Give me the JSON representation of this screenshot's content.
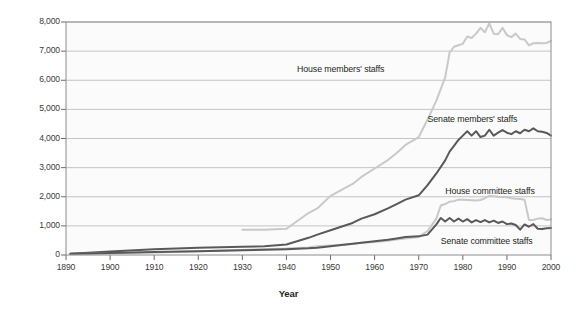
{
  "chart_data": {
    "type": "line",
    "title": "",
    "xlabel": "Year",
    "ylabel": "Number of Employees",
    "xlim": [
      1890,
      2000
    ],
    "ylim": [
      0,
      8000
    ],
    "grid": true,
    "legend_position": "inline-annotations",
    "xticks": [
      "1890",
      "1900",
      "1910",
      "1920",
      "1930",
      "1940",
      "1950",
      "1960",
      "1970",
      "1980",
      "1990",
      "2000"
    ],
    "yticks": [
      "0",
      "1,000",
      "2,000",
      "3,000",
      "4,000",
      "5,000",
      "6,000",
      "7,000",
      "8,000"
    ],
    "series": [
      {
        "name": "House members' staffs",
        "color": "#c9c9c9",
        "label_x": 1956,
        "label_y": 6350,
        "x": [
          1930,
          1935,
          1940,
          1945,
          1947,
          1950,
          1955,
          1957,
          1960,
          1963,
          1965,
          1967,
          1970,
          1972,
          1974,
          1976,
          1977,
          1978,
          1979,
          1980,
          1981,
          1982,
          1983,
          1984,
          1985,
          1986,
          1987,
          1988,
          1989,
          1990,
          1991,
          1992,
          1993,
          1994,
          1995,
          1996,
          1997,
          1998,
          1999,
          2000
        ],
        "values": [
          870,
          870,
          900,
          1440,
          1600,
          2030,
          2440,
          2680,
          2970,
          3260,
          3500,
          3780,
          4050,
          4650,
          5300,
          6100,
          6950,
          7150,
          7200,
          7250,
          7500,
          7450,
          7600,
          7800,
          7650,
          7950,
          7600,
          7580,
          7800,
          7550,
          7480,
          7600,
          7420,
          7400,
          7200,
          7270,
          7280,
          7270,
          7280,
          7350
        ]
      },
      {
        "name": "Senate members' staffs",
        "color": "#595959",
        "label_x": 1972,
        "label_y": 4620,
        "x": [
          1891,
          1900,
          1910,
          1920,
          1930,
          1935,
          1940,
          1945,
          1947,
          1950,
          1955,
          1957,
          1960,
          1963,
          1965,
          1967,
          1970,
          1972,
          1974,
          1976,
          1977,
          1978,
          1979,
          1980,
          1981,
          1982,
          1983,
          1984,
          1985,
          1986,
          1987,
          1988,
          1989,
          1990,
          1991,
          1992,
          1993,
          1994,
          1995,
          1996,
          1997,
          1998,
          1999,
          2000
        ],
        "values": [
          40,
          120,
          200,
          250,
          280,
          300,
          360,
          590,
          700,
          850,
          1100,
          1250,
          1400,
          1600,
          1750,
          1900,
          2050,
          2400,
          2800,
          3250,
          3550,
          3750,
          3950,
          4100,
          4250,
          4100,
          4250,
          4050,
          4100,
          4300,
          4100,
          4200,
          4290,
          4200,
          4150,
          4250,
          4180,
          4300,
          4250,
          4350,
          4250,
          4230,
          4190,
          4100
        ]
      },
      {
        "name": "House committee staffs",
        "color": "#c9c9c9",
        "label_x": 1976,
        "label_y": 2160,
        "x": [
          1891,
          1900,
          1910,
          1920,
          1930,
          1935,
          1940,
          1945,
          1947,
          1950,
          1955,
          1957,
          1960,
          1963,
          1965,
          1967,
          1970,
          1972,
          1974,
          1975,
          1976,
          1977,
          1978,
          1979,
          1980,
          1981,
          1982,
          1983,
          1984,
          1985,
          1986,
          1987,
          1988,
          1989,
          1990,
          1991,
          1992,
          1993,
          1994,
          1995,
          1996,
          1997,
          1998,
          1999,
          2000
        ],
        "values": [
          30,
          60,
          90,
          130,
          170,
          200,
          220,
          260,
          300,
          330,
          380,
          420,
          450,
          490,
          530,
          570,
          620,
          820,
          1250,
          1700,
          1750,
          1830,
          1850,
          1900,
          1900,
          1890,
          1880,
          1870,
          1890,
          1950,
          2030,
          2020,
          2000,
          1990,
          1980,
          1950,
          1930,
          1920,
          1900,
          1200,
          1200,
          1250,
          1260,
          1200,
          1220
        ]
      },
      {
        "name": "Senate committee staffs",
        "color": "#595959",
        "label_x": 1975,
        "label_y": 440,
        "x": [
          1891,
          1900,
          1910,
          1920,
          1930,
          1935,
          1940,
          1945,
          1947,
          1950,
          1955,
          1957,
          1960,
          1963,
          1965,
          1967,
          1970,
          1972,
          1974,
          1975,
          1976,
          1977,
          1978,
          1979,
          1980,
          1981,
          1982,
          1983,
          1984,
          1985,
          1986,
          1987,
          1988,
          1989,
          1990,
          1991,
          1992,
          1993,
          1994,
          1995,
          1996,
          1997,
          1998,
          1999,
          2000
        ],
        "values": [
          40,
          70,
          100,
          130,
          160,
          180,
          200,
          230,
          250,
          300,
          390,
          420,
          470,
          520,
          570,
          620,
          640,
          700,
          1050,
          1270,
          1150,
          1270,
          1150,
          1250,
          1150,
          1230,
          1120,
          1200,
          1130,
          1200,
          1120,
          1180,
          1100,
          1150,
          1060,
          1080,
          1030,
          870,
          1050,
          970,
          1060,
          900,
          890,
          920,
          930
        ]
      }
    ]
  },
  "axes": {
    "y_title": "Number of Employees",
    "x_title": "Year"
  }
}
